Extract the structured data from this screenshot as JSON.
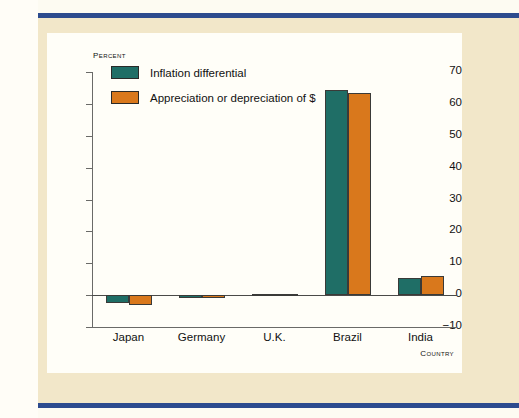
{
  "page": {
    "accent_rule_color": "#2d4b8e",
    "paper_color": "#f2e7c9",
    "panel_color": "#fffef8"
  },
  "chart_data": {
    "type": "bar",
    "title": "",
    "subtitle": "",
    "xlabel": "Country",
    "ylabel": "Percent",
    "ylim": [
      -10,
      70
    ],
    "yticks": [
      -10,
      0,
      10,
      20,
      30,
      40,
      50,
      60,
      70
    ],
    "ytick_labels": [
      "-10",
      "0",
      "10",
      "20",
      "30",
      "40",
      "50",
      "60",
      "70"
    ],
    "grid": false,
    "legend_position": "upper-left",
    "categories": [
      "Japan",
      "Germany",
      "U.K.",
      "Brazil",
      "India"
    ],
    "series": [
      {
        "name": "Inflation differential",
        "color": "#1f6e66",
        "values": [
          -2.5,
          -0.8,
          0.5,
          64.5,
          5.5
        ]
      },
      {
        "name": "Appreciation or depreciation of $",
        "color": "#d9781c",
        "values": [
          -3.0,
          -1.0,
          0.5,
          63.5,
          6.0
        ]
      }
    ]
  }
}
